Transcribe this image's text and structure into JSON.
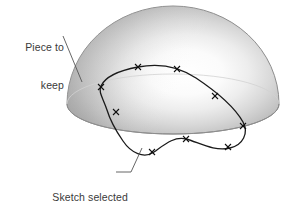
{
  "figure": {
    "type": "technical-illustration",
    "background_color": "#ffffff"
  },
  "annotations": {
    "keep": {
      "line1": "Piece to",
      "line2": "keep",
      "leader_from": [
        63,
        36
      ],
      "leader_to": [
        82,
        82
      ]
    },
    "sketch": {
      "line1": "Sketch selected",
      "line2": "as trim tool",
      "leader_from": [
        116,
        172
      ],
      "leader_to": [
        142,
        148
      ]
    }
  },
  "shape": {
    "name": "dome",
    "outline_color": "#8a8a8a",
    "shade_dark": "#9e9e9e",
    "shade_mid": "#c2c2c2",
    "highlight": "#ffffff",
    "center": [
      173,
      104
    ],
    "radius_x": 106,
    "radius_y": 98,
    "base_ellipse_ry": 30
  },
  "sketch_curve": {
    "name": "kidney-spline",
    "stroke_color": "#1a1a1a",
    "stroke_width": 1.3,
    "point_marker": "x-cross",
    "points": [
      [
        138,
        67
      ],
      [
        177,
        69
      ],
      [
        215,
        96
      ],
      [
        243,
        126
      ],
      [
        228,
        147
      ],
      [
        186,
        139
      ],
      [
        152,
        152
      ],
      [
        116,
        112
      ],
      [
        101,
        88
      ]
    ]
  },
  "colors": {
    "text": "#3a3a3a",
    "leader": "#555555",
    "curve": "#1a1a1a"
  }
}
